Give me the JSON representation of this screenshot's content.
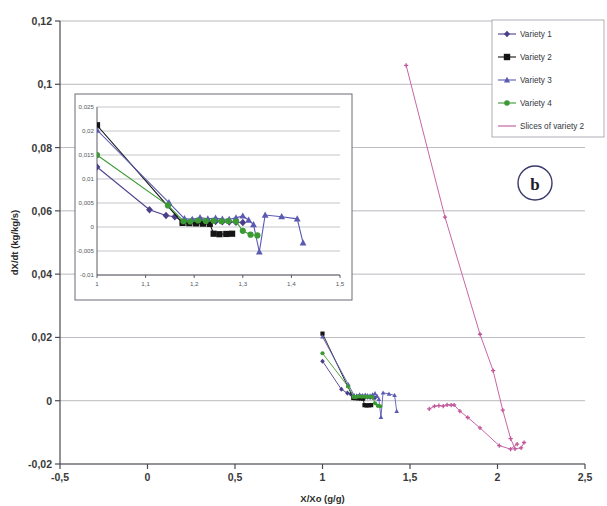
{
  "chart_data": {
    "type": "scatter",
    "title": "",
    "panel_label": "b",
    "xlabel": "X/Xo (g/g)",
    "ylabel": "dX/dt (kg/kg/s)",
    "xlim": [
      -0.5,
      2.5
    ],
    "ylim": [
      -0.02,
      0.12
    ],
    "xticks": [
      -0.5,
      0,
      0.5,
      1,
      1.5,
      2,
      2.5
    ],
    "yticks": [
      -0.02,
      0,
      0.02,
      0.04,
      0.06,
      0.08,
      0.1,
      0.12
    ],
    "xtick_labels": [
      "-0,5",
      "0",
      "0,5",
      "1",
      "1,5",
      "2",
      "2,5"
    ],
    "ytick_labels": [
      "-0,02",
      "0",
      "0,02",
      "0,04",
      "0,06",
      "0,08",
      "0,1",
      "0,12"
    ],
    "grid": "horizontal",
    "legend_position": "top-right",
    "series": [
      {
        "name": "Variety 1",
        "color": "#4b3f8c",
        "marker": "diamond",
        "points": [
          [
            1.0,
            0.0125
          ],
          [
            1.108,
            0.0036
          ],
          [
            1.142,
            0.0024
          ],
          [
            1.16,
            0.00215
          ],
          [
            1.178,
            0.00105
          ],
          [
            1.196,
            0.0013
          ],
          [
            1.212,
            0.00125
          ],
          [
            1.228,
            0.0012
          ],
          [
            1.244,
            0.00115
          ],
          [
            1.258,
            0.0011
          ],
          [
            1.272,
            0.00105
          ],
          [
            1.286,
            0.001
          ],
          [
            1.3,
            0.00095
          ]
        ]
      },
      {
        "name": "Variety 2",
        "color": "#151515",
        "marker": "square",
        "points": [
          [
            1.0,
            0.0212
          ],
          [
            1.176,
            0.00085
          ],
          [
            1.19,
            0.0008
          ],
          [
            1.204,
            0.00075
          ],
          [
            1.218,
            0.0007
          ],
          [
            1.232,
            0.00065
          ],
          [
            1.24,
            -0.0014
          ],
          [
            1.252,
            -0.0015
          ],
          [
            1.266,
            -0.00145
          ],
          [
            1.278,
            -0.0014
          ]
        ]
      },
      {
        "name": "Variety 3",
        "color": "#5a5ab4",
        "marker": "triangle",
        "points": [
          [
            1.0,
            0.0202
          ],
          [
            1.148,
            0.0051
          ],
          [
            1.18,
            0.00175
          ],
          [
            1.196,
            0.0016
          ],
          [
            1.212,
            0.00195
          ],
          [
            1.228,
            0.0017
          ],
          [
            1.244,
            0.00185
          ],
          [
            1.258,
            0.00165
          ],
          [
            1.272,
            0.0016
          ],
          [
            1.286,
            0.0019
          ],
          [
            1.3,
            0.0023
          ],
          [
            1.312,
            0.00145
          ],
          [
            1.322,
            0.0005
          ],
          [
            1.334,
            -0.0052
          ],
          [
            1.346,
            0.0025
          ],
          [
            1.38,
            0.00215
          ],
          [
            1.412,
            0.0017
          ],
          [
            1.424,
            -0.0033
          ]
        ]
      },
      {
        "name": "Variety 4",
        "color": "#3c9a34",
        "marker": "circle",
        "points": [
          [
            1.0,
            0.015
          ],
          [
            1.146,
            0.0045
          ],
          [
            1.178,
            0.0012
          ],
          [
            1.192,
            0.00115
          ],
          [
            1.208,
            0.00135
          ],
          [
            1.224,
            0.00125
          ],
          [
            1.24,
            0.0013
          ],
          [
            1.256,
            0.0012
          ],
          [
            1.27,
            0.00125
          ],
          [
            1.286,
            0.00115
          ],
          [
            1.3,
            -0.0008
          ],
          [
            1.316,
            -0.0016
          ],
          [
            1.33,
            -0.00175
          ]
        ]
      },
      {
        "name": "Slices of variety 2",
        "color": "#c0569a",
        "marker": "cross",
        "points": [
          [
            1.478,
            0.106
          ],
          [
            1.7,
            0.058
          ],
          [
            1.9,
            0.021
          ],
          [
            1.975,
            0.0095
          ],
          [
            2.03,
            -0.003
          ],
          [
            2.075,
            -0.012
          ],
          [
            2.1,
            -0.0152
          ],
          [
            2.135,
            -0.0149
          ],
          [
            2.152,
            -0.0132
          ]
        ]
      },
      {
        "name": "Slices of variety 2 (low branch)",
        "color": "#c0569a",
        "marker": "cross",
        "parent": "Slices of variety 2",
        "points": [
          [
            1.61,
            -0.0026
          ],
          [
            1.64,
            -0.00175
          ],
          [
            1.665,
            -0.00155
          ],
          [
            1.69,
            -0.0017
          ],
          [
            1.712,
            -0.0013
          ],
          [
            1.735,
            -0.0014
          ],
          [
            1.752,
            -0.00135
          ],
          [
            1.785,
            -0.0033
          ],
          [
            1.83,
            -0.0053
          ],
          [
            1.9,
            -0.0086
          ],
          [
            2.01,
            -0.0142
          ],
          [
            2.075,
            -0.0153
          ],
          [
            2.112,
            -0.0137
          ]
        ]
      }
    ],
    "inset": {
      "xlim": [
        1.0,
        1.5
      ],
      "ylim": [
        -0.01,
        0.025
      ],
      "xticks": [
        1,
        1.1,
        1.2,
        1.3,
        1.4,
        1.5
      ],
      "yticks": [
        -0.01,
        -0.005,
        0,
        0.005,
        0.01,
        0.015,
        0.02,
        0.025
      ],
      "xtick_labels": [
        "1",
        "1,1",
        "1,2",
        "1,3",
        "1,4",
        "1,5"
      ],
      "ytick_labels": [
        "-0,01",
        "-0,005",
        "0",
        "0,005",
        "0,01",
        "0,015",
        "0,02",
        "0,025"
      ],
      "grid": "horizontal"
    }
  },
  "legend": {
    "entries": [
      {
        "label": "Variety 1"
      },
      {
        "label": "Variety 2"
      },
      {
        "label": "Variety 3"
      },
      {
        "label": "Variety 4"
      },
      {
        "label": "Slices of variety 2"
      }
    ]
  },
  "colors": {
    "variety1": "#4b3f8c",
    "variety2": "#151515",
    "variety3": "#5a5ab4",
    "variety4": "#3c9a34",
    "slices": "#c0569a",
    "grid": "#8a8a96",
    "axis": "#4a4a52",
    "inset_border": "#6b6b78",
    "panel_circle": "#3a3a6a"
  }
}
